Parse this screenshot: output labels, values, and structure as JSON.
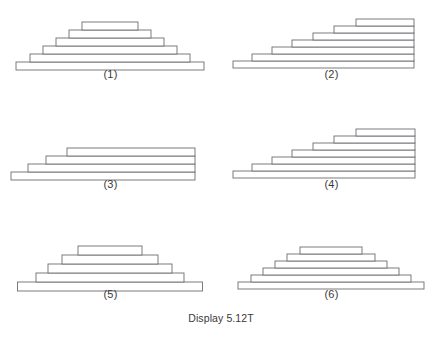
{
  "caption": "Display 5.12T",
  "figures": [
    {
      "label": "(1)",
      "arrangement": "symmetric-pyramid",
      "bar_count": 6,
      "bar_height": 8,
      "bar_widths": [
        188,
        160,
        134,
        108,
        82,
        56
      ],
      "base_y": 62,
      "center_x": 110
    },
    {
      "label": "(2)",
      "arrangement": "right-aligned-staircase",
      "bar_count": 7,
      "bar_height": 7,
      "bar_widths": [
        181,
        162,
        142,
        122,
        101,
        80,
        58
      ],
      "base_y": 61,
      "right_x": 193
    },
    {
      "label": "(3)",
      "arrangement": "right-aligned-staircase",
      "bar_count": 4,
      "bar_height": 8,
      "bar_widths": [
        184,
        167,
        149,
        128
      ],
      "base_y": 62,
      "right_x": 195
    },
    {
      "label": "(4)",
      "arrangement": "right-aligned-staircase",
      "bar_count": 7,
      "bar_height": 7,
      "bar_widths": [
        182,
        163,
        143,
        123,
        102,
        81,
        59
      ],
      "base_y": 61,
      "right_x": 194
    },
    {
      "label": "(5)",
      "arrangement": "symmetric-pyramid",
      "bar_count": 5,
      "bar_height": 9,
      "bar_widths": [
        185,
        148,
        124,
        96,
        64
      ],
      "base_y": 62,
      "center_x": 110
    },
    {
      "label": "(6)",
      "arrangement": "symmetric-pyramid",
      "bar_count": 6,
      "bar_height": 7,
      "bar_widths": [
        186,
        160,
        136,
        112,
        88,
        62
      ],
      "base_y": 62,
      "center_x": 110
    }
  ],
  "chart_data": {
    "type": "bar",
    "title": "Display 5.12T",
    "xlabel": "",
    "ylabel": "",
    "orientation": "horizontal",
    "panels": [
      {
        "name": "(1)",
        "shape": "symmetric pyramid, 6 stacked horizontal bars centered on a common axis, widths decreasing upward",
        "alignment": "center",
        "values": [
          188,
          160,
          134,
          108,
          82,
          56
        ]
      },
      {
        "name": "(2)",
        "shape": "right-aligned staircase, 7 stacked horizontal bars, widths decreasing upward",
        "alignment": "right",
        "values": [
          181,
          162,
          142,
          122,
          101,
          80,
          58
        ]
      },
      {
        "name": "(3)",
        "shape": "right-aligned staircase, 4 stacked horizontal bars, nearly equal long widths",
        "alignment": "right",
        "values": [
          184,
          167,
          149,
          128
        ]
      },
      {
        "name": "(4)",
        "shape": "right-aligned staircase, 7 stacked horizontal bars, widths decreasing upward",
        "alignment": "right",
        "values": [
          182,
          163,
          143,
          123,
          102,
          81,
          59
        ]
      },
      {
        "name": "(5)",
        "shape": "symmetric pyramid, 5 stacked horizontal bars centered, widths decreasing upward",
        "alignment": "center",
        "values": [
          185,
          148,
          124,
          96,
          64
        ]
      },
      {
        "name": "(6)",
        "shape": "symmetric pyramid, 6 stacked horizontal bars centered, widths decreasing upward",
        "alignment": "center",
        "values": [
          186,
          160,
          136,
          112,
          88,
          62
        ]
      }
    ],
    "grid": false,
    "legend": null
  },
  "colors": {
    "stroke": "#6d6e71",
    "fill": "#ffffff",
    "text": "#3a3a3a",
    "background": "#ffffff"
  }
}
